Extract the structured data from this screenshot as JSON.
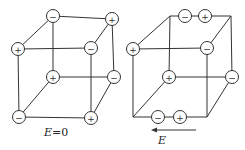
{
  "figure": {
    "left_cube": {
      "caption": "E=0",
      "caption_var": "E",
      "caption_rest": "=0",
      "ions": [
        {
          "pos": "top-back-left",
          "sign": "−",
          "x": 53,
          "y": 16
        },
        {
          "pos": "top-back-right",
          "sign": "+",
          "x": 112,
          "y": 19
        },
        {
          "pos": "top-front-left",
          "sign": "+",
          "x": 18,
          "y": 49
        },
        {
          "pos": "top-front-right",
          "sign": "−",
          "x": 91,
          "y": 48
        },
        {
          "pos": "bottom-back-left",
          "sign": "+",
          "x": 53,
          "y": 77
        },
        {
          "pos": "bottom-back-right",
          "sign": "−",
          "x": 114,
          "y": 77
        },
        {
          "pos": "bottom-front-left",
          "sign": "−",
          "x": 19,
          "y": 117
        },
        {
          "pos": "bottom-front-right",
          "sign": "+",
          "x": 91,
          "y": 118
        }
      ]
    },
    "right_cube": {
      "caption": "E",
      "arrow_direction": "left",
      "ions": [
        {
          "pos": "top-back-edge-1",
          "sign": "−",
          "x": 185,
          "y": 16
        },
        {
          "pos": "top-back-edge-2",
          "sign": "+",
          "x": 205,
          "y": 16
        },
        {
          "pos": "top-front-left",
          "sign": "+",
          "x": 133,
          "y": 49
        },
        {
          "pos": "top-front-right",
          "sign": "−",
          "x": 207,
          "y": 48
        },
        {
          "pos": "bottom-back-left",
          "sign": "+",
          "x": 169,
          "y": 77
        },
        {
          "pos": "bottom-back-right",
          "sign": "−",
          "x": 232,
          "y": 77
        },
        {
          "pos": "bottom-front-edge-1",
          "sign": "−",
          "x": 158,
          "y": 117
        },
        {
          "pos": "bottom-front-edge-2",
          "sign": "+",
          "x": 180,
          "y": 117
        }
      ]
    }
  }
}
